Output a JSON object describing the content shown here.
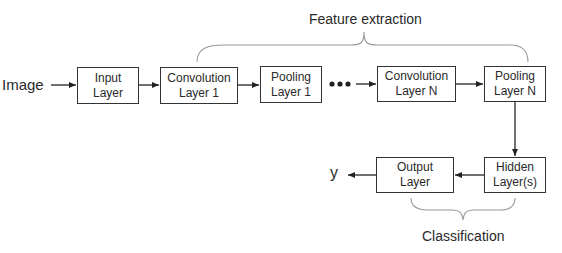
{
  "diagram": {
    "input_label": "Image",
    "output_label": "y",
    "ellipsis": "•••",
    "groups": {
      "feature_extraction": "Feature extraction",
      "classification": "Classification"
    },
    "nodes": [
      {
        "id": "input",
        "line1": "Input",
        "line2": "Layer"
      },
      {
        "id": "conv1",
        "line1": "Convolution",
        "line2": "Layer 1"
      },
      {
        "id": "pool1",
        "line1": "Pooling",
        "line2": "Layer 1"
      },
      {
        "id": "convN",
        "line1": "Convolution",
        "line2": "Layer N"
      },
      {
        "id": "poolN",
        "line1": "Pooling",
        "line2": "Layer N"
      },
      {
        "id": "hidden",
        "line1": "Hidden",
        "line2": "Layer(s)"
      },
      {
        "id": "output",
        "line1": "Output",
        "line2": "Layer"
      }
    ],
    "edges": [
      [
        "Image",
        "input"
      ],
      [
        "input",
        "conv1"
      ],
      [
        "conv1",
        "pool1"
      ],
      [
        "pool1",
        "convN"
      ],
      [
        "convN",
        "poolN"
      ],
      [
        "poolN",
        "hidden"
      ],
      [
        "hidden",
        "output"
      ],
      [
        "output",
        "y"
      ]
    ]
  }
}
